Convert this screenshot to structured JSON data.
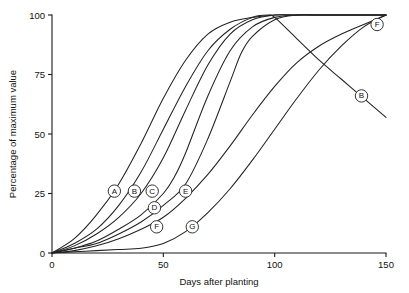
{
  "chart_data": {
    "type": "line",
    "title": "",
    "xlabel": "Days after planting",
    "ylabel": "Percentage of maximum value",
    "xlim": [
      0,
      150
    ],
    "ylim": [
      0,
      100
    ],
    "xticks": [
      0,
      50,
      100,
      150
    ],
    "yticks": [
      0,
      25,
      50,
      75,
      100
    ],
    "xtick_labels": [
      "0",
      "50",
      "100",
      "150"
    ],
    "ytick_labels": [
      "0",
      "25",
      "50",
      "75",
      "100"
    ],
    "grid": false,
    "legend": "inline-labels",
    "series": [
      {
        "name": "A",
        "label": "A",
        "label_x": 28,
        "label_y": 26,
        "x": [
          0,
          10,
          20,
          30,
          40,
          50,
          60,
          70,
          80,
          90,
          100,
          110,
          120,
          130,
          140,
          150
        ],
        "y": [
          0,
          6,
          16,
          29,
          46,
          65,
          81,
          92,
          97,
          99,
          100,
          100,
          100,
          100,
          100,
          100
        ]
      },
      {
        "name": "B",
        "label": "B",
        "label_x": 37,
        "label_y": 26,
        "label2": "B",
        "label2_x": 139,
        "label2_y": 66,
        "x": [
          0,
          10,
          20,
          30,
          40,
          50,
          60,
          70,
          80,
          90,
          97,
          100,
          110,
          120,
          130,
          140,
          150
        ],
        "y": [
          0,
          4,
          10,
          20,
          34,
          52,
          70,
          85,
          94,
          99,
          100,
          99,
          90,
          81,
          73,
          65,
          57
        ]
      },
      {
        "name": "C",
        "label": "C",
        "label_x": 45,
        "label_y": 26,
        "x": [
          0,
          10,
          20,
          30,
          40,
          50,
          60,
          70,
          80,
          90,
          100,
          110,
          120,
          130,
          140,
          150
        ],
        "y": [
          0,
          3,
          8,
          15,
          25,
          40,
          60,
          79,
          92,
          98,
          100,
          100,
          100,
          100,
          100,
          100
        ]
      },
      {
        "name": "D",
        "label": "D",
        "label_x": 46,
        "label_y": 19,
        "x": [
          0,
          10,
          20,
          30,
          40,
          50,
          55,
          60,
          70,
          80,
          90,
          100,
          110,
          120,
          130,
          140,
          150
        ],
        "y": [
          0,
          2,
          5,
          10,
          16,
          25,
          32,
          42,
          66,
          85,
          95,
          99,
          100,
          100,
          100,
          100,
          100
        ]
      },
      {
        "name": "E",
        "label": "E",
        "label_x": 60,
        "label_y": 26,
        "x": [
          0,
          10,
          20,
          30,
          40,
          50,
          60,
          70,
          80,
          85,
          90,
          100,
          110,
          120,
          130,
          140,
          150
        ],
        "y": [
          0,
          2,
          4,
          8,
          13,
          20,
          29,
          48,
          72,
          84,
          91,
          98,
          100,
          100,
          100,
          100,
          100
        ]
      },
      {
        "name": "F",
        "label": "F",
        "label_x": 47,
        "label_y": 11,
        "label2": "F",
        "label2_x": 146,
        "label2_y": 96,
        "x": [
          0,
          10,
          20,
          30,
          40,
          50,
          60,
          70,
          80,
          90,
          100,
          110,
          120,
          130,
          140,
          150
        ],
        "y": [
          0,
          1,
          3,
          6,
          10,
          15,
          23,
          33,
          45,
          58,
          70,
          80,
          87,
          92,
          96,
          100
        ]
      },
      {
        "name": "G",
        "label": "G",
        "label_x": 63,
        "label_y": 11,
        "x": [
          0,
          10,
          20,
          30,
          40,
          50,
          60,
          70,
          80,
          90,
          100,
          110,
          120,
          130,
          140,
          150
        ],
        "y": [
          0,
          0.5,
          1,
          1.5,
          2,
          4,
          9,
          17,
          27,
          39,
          52,
          65,
          77,
          87,
          95,
          100
        ]
      }
    ]
  },
  "colors": {
    "curve": "#222222",
    "axis": "#1a1a1a",
    "background": "#ffffff"
  }
}
